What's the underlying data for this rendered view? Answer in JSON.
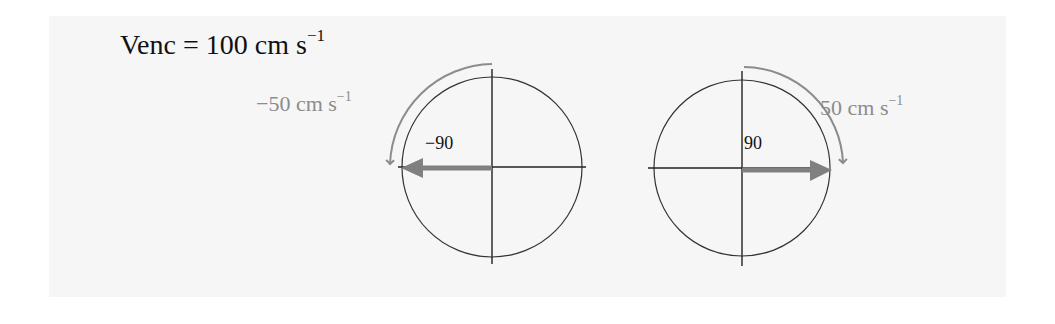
{
  "title": {
    "prefix": "Venc = 100 cm s",
    "exponent": "−1"
  },
  "diagrams": [
    {
      "id": "left",
      "phase_label": "−90",
      "velocity_prefix": "−50 cm s",
      "velocity_exponent": "−1",
      "rotation": "counterclockwise",
      "vector_direction": "left"
    },
    {
      "id": "right",
      "phase_label": "90",
      "velocity_prefix": "50 cm s",
      "velocity_exponent": "−1",
      "rotation": "clockwise",
      "vector_direction": "right"
    }
  ],
  "colors": {
    "background": "#f6f6f6",
    "axis": "#222222",
    "vector": "#808080",
    "arc": "#8c8c8c",
    "velocity_text": "#8c8c8c",
    "text": "#111111"
  }
}
